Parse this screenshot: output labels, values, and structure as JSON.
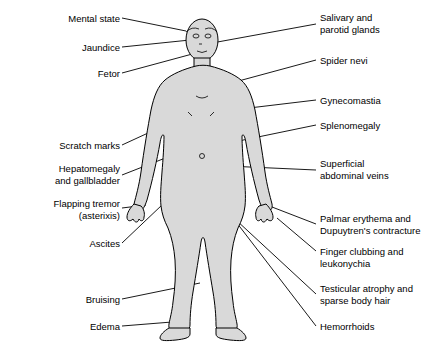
{
  "diagram": {
    "type": "anatomical-annotation-diagram",
    "figure_colors": {
      "body_fill": "#d9d9d9",
      "body_outline": "#000000",
      "leader_line": "#000000",
      "background": "#ffffff"
    },
    "left_labels": [
      {
        "id": "mental-state",
        "text": "Mental state",
        "x": 24,
        "y": 13,
        "width": 96,
        "anchor_x": 186,
        "anchor_y": 31
      },
      {
        "id": "jaundice",
        "text": "Jaundice",
        "x": 43,
        "y": 42,
        "width": 77,
        "anchor_x": 190,
        "anchor_y": 40
      },
      {
        "id": "fetor",
        "text": "Fetor",
        "x": 62,
        "y": 68,
        "width": 58,
        "anchor_x": 196,
        "anchor_y": 51
      },
      {
        "id": "scratch-marks",
        "text": "Scratch marks",
        "x": 22,
        "y": 140,
        "width": 98,
        "anchor_x": 185,
        "anchor_y": 113
      },
      {
        "id": "hepatomegaly-and-gallbladder",
        "text": "Hepatomegaly\nand gallbladder",
        "x": 14,
        "y": 163,
        "width": 106,
        "anchor_x": 196,
        "anchor_y": 143
      },
      {
        "id": "flapping-tremor-asterixis",
        "text": "Flapping tremor\n(asterixis)",
        "x": 12,
        "y": 198,
        "width": 108,
        "anchor_x": 144,
        "anchor_y": 205
      },
      {
        "id": "ascites",
        "text": "Ascites",
        "x": 57,
        "y": 238,
        "width": 63,
        "anchor_x": 203,
        "anchor_y": 163
      },
      {
        "id": "bruising",
        "text": "Bruising",
        "x": 51,
        "y": 294,
        "width": 69,
        "anchor_x": 201,
        "anchor_y": 282
      },
      {
        "id": "edema",
        "text": "Edema",
        "x": 60,
        "y": 321,
        "width": 60,
        "anchor_x": 170,
        "anchor_y": 320
      }
    ],
    "right_labels": [
      {
        "id": "salivary-and-parotid-glands",
        "text": "Salivary and\nparotid glands",
        "x": 320,
        "y": 12,
        "anchor_x": 211,
        "anchor_y": 42
      },
      {
        "id": "spider-nevi",
        "text": "Spider nevi",
        "x": 320,
        "y": 55,
        "anchor_x": 220,
        "anchor_y": 85
      },
      {
        "id": "gynecomastia",
        "text": "Gynecomastia",
        "x": 320,
        "y": 95,
        "anchor_x": 224,
        "anchor_y": 110
      },
      {
        "id": "splenomegaly",
        "text": "Splenomegaly",
        "x": 320,
        "y": 120,
        "anchor_x": 224,
        "anchor_y": 143
      },
      {
        "id": "superficial-abdominal-veins",
        "text": "Superficial\nabdominal veins",
        "x": 320,
        "y": 158,
        "anchor_x": 226,
        "anchor_y": 165
      },
      {
        "id": "palmar-erythema-dupuytrens",
        "text": "Palmar erythema and\nDupuytren's contracture",
        "x": 320,
        "y": 213,
        "anchor_x": 272,
        "anchor_y": 205
      },
      {
        "id": "finger-clubbing-leukonychia",
        "text": "Finger clubbing and\nleukonychia",
        "x": 320,
        "y": 246,
        "anchor_x": 276,
        "anchor_y": 216
      },
      {
        "id": "testicular-atrophy-sparse-body-hair",
        "text": "Testicular atrophy and\nsparse body hair",
        "x": 320,
        "y": 283,
        "anchor_x": 221,
        "anchor_y": 205
      },
      {
        "id": "hemorrhoids",
        "text": "Hemorrhoids",
        "x": 320,
        "y": 321,
        "anchor_x": 228,
        "anchor_y": 212
      }
    ]
  }
}
